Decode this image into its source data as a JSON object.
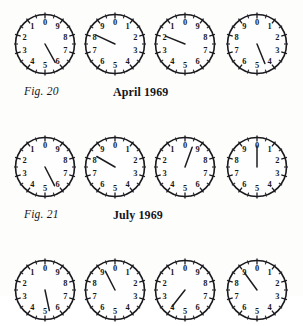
{
  "page": {
    "background_color": "#fdfdfc",
    "ink_color": "#1b1b1f",
    "width": 303,
    "height": 296
  },
  "dial_numbers": [
    "0",
    "1",
    "2",
    "3",
    "4",
    "5",
    "6",
    "7",
    "8",
    "9"
  ],
  "rows": [
    {
      "id": "row-1",
      "top": 11,
      "fig_label": "Fig. 20",
      "date_label": "April 1969",
      "caption_top": 85,
      "clipped": false,
      "dials": [
        {
          "name": "dial-1",
          "left": 12,
          "direction": "counterclockwise",
          "pointer_value": 5.8,
          "pointer_angle_deg": 151
        },
        {
          "name": "dial-2",
          "left": 82,
          "direction": "clockwise",
          "pointer_value": 8.2,
          "pointer_angle_deg": 295
        },
        {
          "name": "dial-3",
          "left": 152,
          "direction": "counterclockwise",
          "pointer_value": 1.9,
          "pointer_angle_deg": 292
        },
        {
          "name": "dial-4",
          "left": 224,
          "direction": "clockwise",
          "pointer_value": 4.4,
          "pointer_angle_deg": 158
        }
      ]
    },
    {
      "id": "row-2",
      "top": 134,
      "fig_label": "Fig. 21",
      "date_label": "July 1969",
      "caption_top": 208,
      "clipped": false,
      "dials": [
        {
          "name": "dial-1",
          "left": 12,
          "direction": "counterclockwise",
          "pointer_value": 5.9,
          "pointer_angle_deg": 153
        },
        {
          "name": "dial-2",
          "left": 82,
          "direction": "clockwise",
          "pointer_value": 8.5,
          "pointer_angle_deg": 300
        },
        {
          "name": "dial-3",
          "left": 152,
          "direction": "counterclockwise",
          "pointer_value": 9.4,
          "pointer_angle_deg": 20
        },
        {
          "name": "dial-4",
          "left": 224,
          "direction": "clockwise",
          "pointer_value": 0.0,
          "pointer_angle_deg": 0
        }
      ]
    },
    {
      "id": "row-3",
      "top": 257,
      "fig_label": "",
      "date_label": "",
      "caption_top": 0,
      "clipped": true,
      "dials": [
        {
          "name": "dial-1",
          "left": 12,
          "direction": "counterclockwise",
          "pointer_value": 5.4,
          "pointer_angle_deg": 168
        },
        {
          "name": "dial-2",
          "left": 82,
          "direction": "clockwise",
          "pointer_value": 9.3,
          "pointer_angle_deg": 333
        },
        {
          "name": "dial-3",
          "left": 152,
          "direction": "counterclockwise",
          "pointer_value": 3.6,
          "pointer_angle_deg": 218
        },
        {
          "name": "dial-4",
          "left": 224,
          "direction": "clockwise",
          "pointer_value": 9.0,
          "pointer_angle_deg": 324
        }
      ]
    }
  ]
}
